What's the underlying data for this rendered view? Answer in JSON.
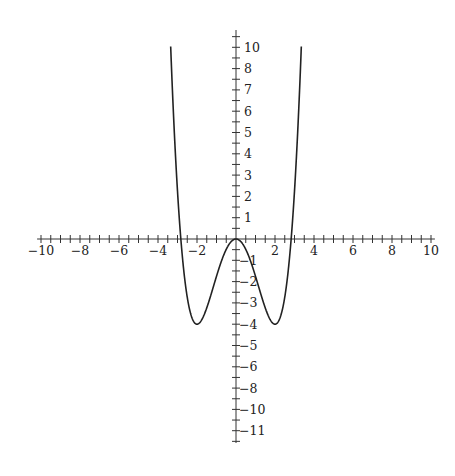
{
  "chart_data": {
    "type": "line",
    "title": "",
    "xlabel": "",
    "ylabel": "",
    "function": "y = x^4/4 - 2x^2",
    "xlim": [
      -10,
      10
    ],
    "ylim": [
      -9.5,
      10
    ],
    "grid": false,
    "legend": null,
    "x_tick_labels": [
      "-10",
      "-8",
      "-6",
      "-4",
      "-2",
      "2",
      "4",
      "6",
      "8",
      "10"
    ],
    "x_tick_label_positions": [
      -10,
      -8,
      -6,
      -4,
      -2,
      2,
      4,
      6,
      8,
      10
    ],
    "y_tick_labels_positive": [
      "1",
      "2",
      "3",
      "4",
      "5",
      "6",
      "7",
      "8",
      "10"
    ],
    "y_tick_labels_negative": [
      "-1",
      "-2",
      "-3",
      "-4",
      "-5",
      "-6",
      "-8",
      "-10",
      "-11"
    ],
    "minor_tick_step": 0.5,
    "series": [
      {
        "name": "f(x)",
        "x": [
          -3.2,
          -3.0,
          -2.83,
          -2.5,
          -2.0,
          -1.5,
          -1.0,
          -0.5,
          0,
          0.5,
          1.0,
          1.5,
          2.0,
          2.5,
          2.83,
          3.0,
          3.2
        ],
        "y": [
          5.7,
          2.25,
          0,
          -2.73,
          -4.0,
          -3.23,
          -1.75,
          -0.48,
          0,
          -0.48,
          -1.75,
          -3.23,
          -4.0,
          -2.73,
          0,
          2.25,
          5.7
        ]
      }
    ],
    "annotations": {
      "local_max": [
        0,
        0
      ],
      "local_minima": [
        [
          -2,
          -4
        ],
        [
          2,
          -4
        ]
      ],
      "roots": [
        -2.83,
        0,
        2.83
      ]
    },
    "colors": {
      "axis": "#333333",
      "curve": "#222222",
      "background": "#ffffff"
    }
  }
}
